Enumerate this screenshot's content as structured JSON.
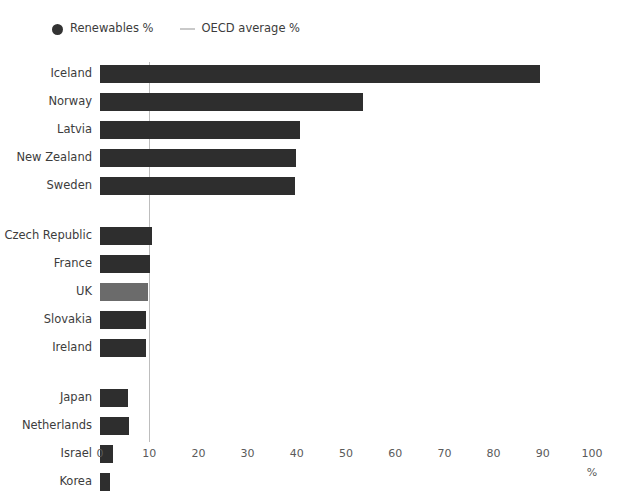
{
  "legend": {
    "items": [
      {
        "label": "Renewables %",
        "marker": "dot-icon",
        "color": "#333333"
      },
      {
        "label": "OECD average %",
        "marker": "line-icon",
        "color": "#c9c9c9"
      }
    ]
  },
  "axis": {
    "unit_label": "%",
    "ticks": [
      "0",
      "10",
      "20",
      "30",
      "40",
      "50",
      "60",
      "70",
      "80",
      "90",
      "100"
    ]
  },
  "chart_data": {
    "type": "bar",
    "orientation": "horizontal",
    "title": "",
    "xlabel": "%",
    "ylabel": "",
    "xlim": [
      0,
      100
    ],
    "xticks": [
      0,
      10,
      20,
      30,
      40,
      50,
      60,
      70,
      80,
      90,
      100
    ],
    "grid": false,
    "legend_position": "top-left",
    "series": [
      {
        "name": "Renewables %",
        "color": "#2e2e2e",
        "highlight_color": "#6b6b6b",
        "groups": [
          {
            "name": "top",
            "points": [
              {
                "category": "Iceland",
                "value": 89.5,
                "highlight": false
              },
              {
                "category": "Norway",
                "value": 53.5,
                "highlight": false
              },
              {
                "category": "Latvia",
                "value": 40.6,
                "highlight": false
              },
              {
                "category": "New Zealand",
                "value": 39.8,
                "highlight": false
              },
              {
                "category": "Sweden",
                "value": 39.6,
                "highlight": false
              }
            ]
          },
          {
            "name": "middle",
            "points": [
              {
                "category": "Czech Republic",
                "value": 10.6,
                "highlight": false
              },
              {
                "category": "France",
                "value": 10.2,
                "highlight": false
              },
              {
                "category": "UK",
                "value": 9.7,
                "highlight": true
              },
              {
                "category": "Slovakia",
                "value": 9.4,
                "highlight": false
              },
              {
                "category": "Ireland",
                "value": 9.4,
                "highlight": false
              }
            ]
          },
          {
            "name": "bottom",
            "points": [
              {
                "category": "Japan",
                "value": 5.6,
                "highlight": false
              },
              {
                "category": "Netherlands",
                "value": 5.8,
                "highlight": false
              },
              {
                "category": "Israel",
                "value": 2.6,
                "highlight": false
              },
              {
                "category": "Korea",
                "value": 2.1,
                "highlight": false
              }
            ]
          }
        ]
      }
    ],
    "reference_line": {
      "name": "OECD average %",
      "value": 9.9,
      "color": "#bdbdbd"
    }
  }
}
